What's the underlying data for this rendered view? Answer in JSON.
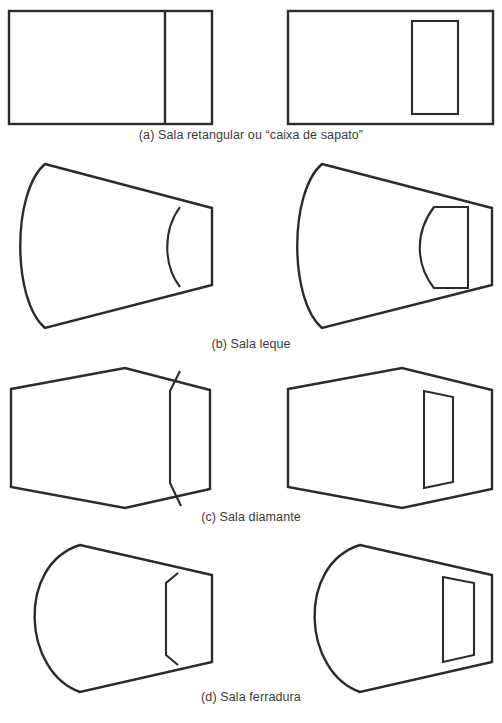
{
  "figure": {
    "line_color": "#2b2b2b",
    "background_color": "#ffffff",
    "rows": [
      {
        "id": "a",
        "caption": "(a) Sala retangular ou “caixa de sapato”",
        "shape_name": "retangular",
        "variants": [
          "planta simples com palco retangular",
          "planta com palco recuado interno"
        ]
      },
      {
        "id": "b",
        "caption": "(b) Sala leque",
        "shape_name": "leque",
        "variants": [
          "planta em leque com parede de fundo curva",
          "planta em leque com palco curvo interno"
        ]
      },
      {
        "id": "c",
        "caption": "(c) Sala diamante",
        "shape_name": "diamante",
        "variants": [
          "planta hexagonal com palco chanfrado",
          "planta hexagonal com palco retangular interno"
        ]
      },
      {
        "id": "d",
        "caption": "(d) Sala ferradura",
        "shape_name": "ferradura",
        "variants": [
          "planta em ferradura com palco chanfrado",
          "planta em ferradura com palco retangular interno"
        ]
      }
    ]
  }
}
